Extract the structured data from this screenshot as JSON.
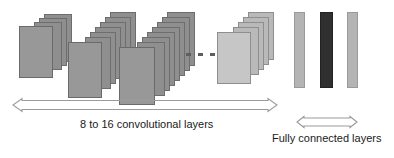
{
  "figure": {
    "background": "#ffffff"
  },
  "colors": {
    "card_fill": "#8f8f8f",
    "card_front_fill": "#989898",
    "card_border": "#6d6d6d",
    "pale_card_fill": "#b9b9b9",
    "pale_card_front_fill": "#c6c6c6",
    "fc_bar_light": "#b4b4b4",
    "fc_bar_dark": "#2f2f2f",
    "arrow_stroke": "#9b9b9b",
    "text": "#1a1a1a",
    "dot": "#5e5e5e"
  },
  "conv_groups": [
    {
      "id": "group-1",
      "label": "first-conv-block",
      "card_count": 3
    },
    {
      "id": "group-2",
      "label": "second-conv-block",
      "card_count": 7
    },
    {
      "id": "group-3",
      "label": "third-conv-block",
      "card_count": 8
    },
    {
      "id": "group-4",
      "label": "last-conv-block",
      "card_count": 5
    }
  ],
  "ellipsis": {
    "name": "omitted-layers-ellipsis",
    "dot_count": 3
  },
  "fully_connected": {
    "bars": [
      {
        "id": "fc-bar-1",
        "shade": "light"
      },
      {
        "id": "fc-bar-2",
        "shade": "dark"
      },
      {
        "id": "fc-bar-3",
        "shade": "light"
      }
    ]
  },
  "annotations": {
    "conv_arrow": {
      "name": "conv-span-arrow",
      "direction": "double",
      "caption": "8 to 16 convolutional layers"
    },
    "fc_arrow": {
      "name": "fc-span-arrow",
      "direction": "double",
      "caption": "Fully connected layers"
    }
  }
}
